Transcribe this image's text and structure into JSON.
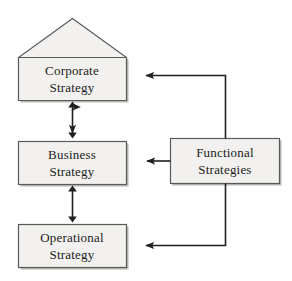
{
  "diagram": {
    "type": "hierarchy-flow-diagram",
    "colors": {
      "box_fill": "#f2f1ef",
      "box_border": "#5a5a58",
      "box_shadow": "#b9b8b5",
      "line": "#1f1f1f",
      "text": "#1c1b1a",
      "background": "#ffffff"
    },
    "nodes": [
      {
        "id": "corporate",
        "shape": "house",
        "line1": "Corporate",
        "line2": "Strategy",
        "x": 18,
        "y": 57,
        "width": 108,
        "height": 43,
        "apex_x": 72,
        "apex_y": 18
      },
      {
        "id": "business",
        "shape": "rect",
        "line1": "Business",
        "line2": "Strategy",
        "x": 18,
        "y": 141,
        "width": 108,
        "height": 43
      },
      {
        "id": "operational",
        "shape": "rect",
        "line1": "Operational",
        "line2": "Strategy",
        "x": 18,
        "y": 224,
        "width": 108,
        "height": 43
      },
      {
        "id": "functional",
        "shape": "rect",
        "line1": "Functional",
        "line2": "Strategies",
        "x": 170,
        "y": 138,
        "width": 110,
        "height": 45
      }
    ],
    "connectors": [
      {
        "id": "corporate-business",
        "kind": "double-arrow-vertical",
        "from": "corporate",
        "to": "business"
      },
      {
        "id": "business-operational",
        "kind": "double-arrow-vertical",
        "from": "business",
        "to": "operational"
      },
      {
        "id": "functional-corporate",
        "kind": "elbow-arrow",
        "from": "functional",
        "to": "corporate"
      },
      {
        "id": "functional-business",
        "kind": "straight-arrow",
        "from": "functional",
        "to": "business"
      },
      {
        "id": "functional-operational",
        "kind": "elbow-arrow",
        "from": "functional",
        "to": "operational"
      }
    ]
  }
}
